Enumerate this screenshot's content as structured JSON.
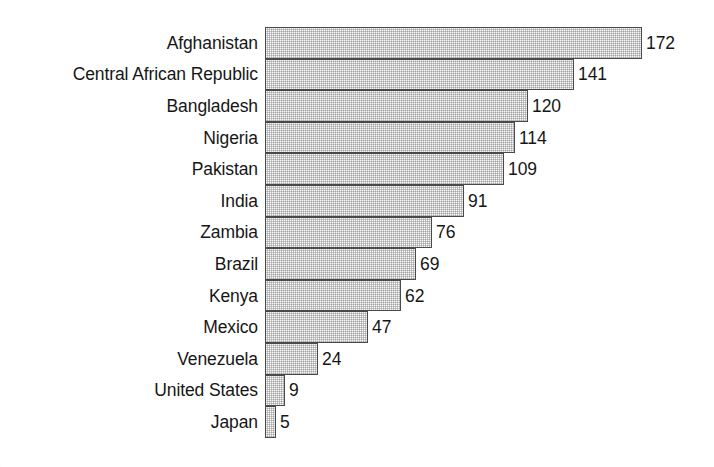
{
  "chart_data": {
    "type": "bar",
    "orientation": "horizontal",
    "title": "",
    "subtitle": "",
    "xlabel": "",
    "ylabel": "",
    "grid": false,
    "legend": null,
    "legend_position": "none",
    "xlim": [
      0,
      172
    ],
    "value_labels_shown": true,
    "categories": [
      "Afghanistan",
      "Central African Republic",
      "Bangladesh",
      "Nigeria",
      "Pakistan",
      "India",
      "Zambia",
      "Brazil",
      "Kenya",
      "Mexico",
      "Venezuela",
      "United States",
      "Japan"
    ],
    "values": [
      172,
      141,
      120,
      114,
      109,
      91,
      76,
      69,
      62,
      47,
      24,
      9,
      5
    ],
    "value_label_texts": [
      "172",
      "141",
      "120",
      "114",
      "109",
      "91",
      "76",
      "69",
      "62",
      "47",
      "24",
      "9",
      "5"
    ],
    "colors": {
      "bar_fill": "#c9c9c9",
      "bar_border": "#4a4a4a",
      "text": "#161616",
      "background": "#ffffff"
    }
  }
}
